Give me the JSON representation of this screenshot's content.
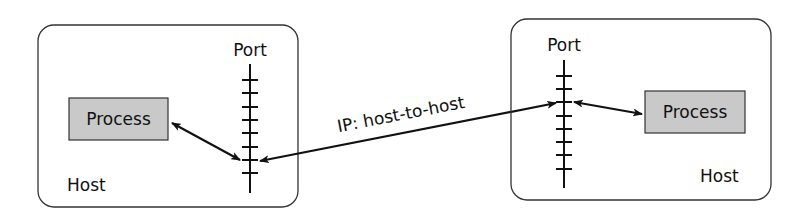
{
  "diagram": {
    "type": "network-ports",
    "colors": {
      "stroke": "#111111",
      "process_fill": "#c9c9c9",
      "background": "#ffffff"
    },
    "hosts": [
      {
        "id": "left",
        "label": "Host",
        "port_label": "Port",
        "process_label": "Process",
        "port_tick_count": 8
      },
      {
        "id": "right",
        "label": "Host",
        "port_label": "Port",
        "process_label": "Process",
        "port_tick_count": 8
      }
    ],
    "connections": [
      {
        "from": "left.process",
        "to": "left.port",
        "bidirectional": true
      },
      {
        "from": "left.port",
        "to": "right.port",
        "bidirectional": true,
        "label": "IP: host-to-host"
      },
      {
        "from": "right.port",
        "to": "right.process",
        "bidirectional": true
      }
    ]
  }
}
